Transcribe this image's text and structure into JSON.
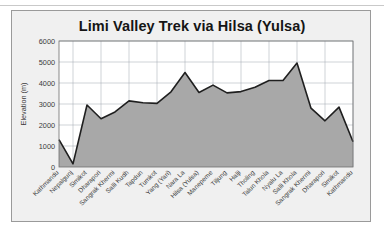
{
  "card": {
    "title": "Limi Valley Trek via Hilsa (Yulsa)",
    "background_color": "#f0f0f0",
    "border_color": "#9a9a9a"
  },
  "chart_data": {
    "type": "area",
    "title": "Limi Valley Trek via Hilsa (Yulsa)",
    "xlabel": "",
    "ylabel": "Elevation (m)",
    "ylim": [
      0,
      6000
    ],
    "ytick_values": [
      0,
      1000,
      2000,
      3000,
      4000,
      5000,
      6000
    ],
    "ytick_labels": [
      "0",
      "1000",
      "2000",
      "3000",
      "4000",
      "5000",
      "6000"
    ],
    "grid": true,
    "legend": "none",
    "xtick_rotation_deg": 45,
    "series_name": "Elevation",
    "line_color": "#1f1f1f",
    "fill_color": "#a8a8a8",
    "grid_color": "#9fa6ad",
    "categories": [
      "Kathmandu",
      "Nepalgunj",
      "Simikot",
      "Dharapori",
      "Sangrak Khermi",
      "Salli Kudh",
      "Tapdun",
      "Tumkot",
      "Yang (Yari)",
      "Nara La",
      "Hilsa (Yulsa)",
      "Manepeme",
      "Tiljung",
      "Halji",
      "Tholing",
      "Talun Khola",
      "Nyalu La",
      "Salli Khola",
      "Sangrak Khermi",
      "Dharapori",
      "Simikot",
      "Kathmandu"
    ],
    "values": [
      1300,
      150,
      2950,
      2300,
      2620,
      3150,
      3060,
      3030,
      3580,
      4500,
      3550,
      3900,
      3530,
      3590,
      3800,
      4120,
      4120,
      4950,
      2800,
      2200,
      2850,
      1200
    ]
  }
}
